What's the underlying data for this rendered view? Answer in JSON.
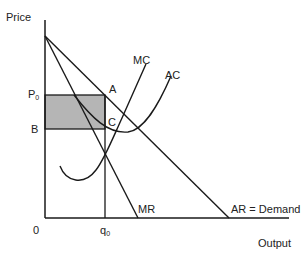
{
  "diagram": {
    "y_axis_label": "Price",
    "x_axis_label": "Output",
    "origin_label": "0",
    "price_label": {
      "main": "P",
      "sub": "0"
    },
    "cost_label": "B",
    "quantity_label": {
      "main": "q",
      "sub": "0"
    },
    "point_labels": {
      "a": "A",
      "c": "C"
    },
    "curve_labels": {
      "mc": "MC",
      "ac": "AC",
      "mr": "MR",
      "ar": "AR = Demand"
    },
    "colors": {
      "line": "#1a1a1a",
      "profit_area": "#b5b5b5",
      "background": "#ffffff"
    }
  }
}
